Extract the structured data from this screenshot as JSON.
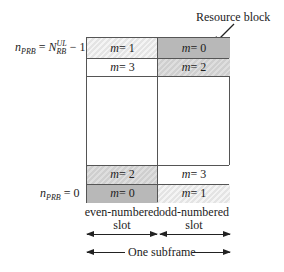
{
  "annotation": {
    "resource_block": "Resource block"
  },
  "axis_labels": {
    "top": {
      "var": "n",
      "var_sub": "PRB",
      "eq": " = ",
      "sym": "N",
      "sym_sup": "UL",
      "sym_sub": "RB",
      "tail": " − 1"
    },
    "bottom": {
      "var": "n",
      "var_sub": "PRB",
      "eq": " = 0"
    }
  },
  "grid": {
    "rows": [
      {
        "even": {
          "var": "m",
          "value": " = 1"
        },
        "odd": {
          "var": "m",
          "value": " = 0"
        }
      },
      {
        "even": {
          "var": "m",
          "value": " = 3"
        },
        "odd": {
          "var": "m",
          "value": " = 2"
        }
      },
      {
        "even": {
          "var": "m",
          "value": " = 2"
        },
        "odd": {
          "var": "m",
          "value": " = 3"
        }
      },
      {
        "even": {
          "var": "m",
          "value": " = 0"
        },
        "odd": {
          "var": "m",
          "value": " = 1"
        }
      }
    ]
  },
  "slots": {
    "even": "even-numbered",
    "odd": "odd-numbered",
    "suffix": "slot"
  },
  "subframe": "One subframe"
}
